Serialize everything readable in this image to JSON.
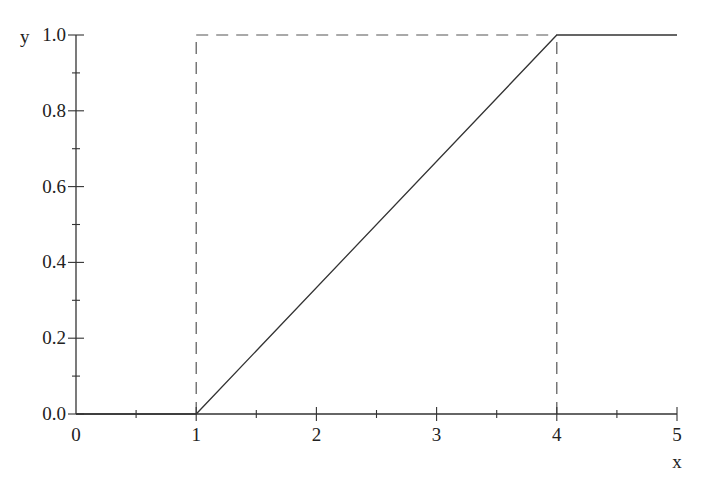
{
  "chart_data": {
    "type": "line",
    "title": "",
    "xlabel": "x",
    "ylabel": "y",
    "xlim": [
      0,
      5
    ],
    "ylim": [
      0,
      1
    ],
    "x_ticks": [
      "0",
      "1",
      "2",
      "3",
      "4",
      "5"
    ],
    "y_ticks": [
      "0.0",
      "0.2",
      "0.4",
      "0.6",
      "0.8",
      "1.0"
    ],
    "x_minor_step": 0.5,
    "y_minor_step": 0.1,
    "grid": false,
    "legend": null,
    "series": [
      {
        "name": "F(x)",
        "style": "solid",
        "x": [
          0,
          1,
          4,
          5
        ],
        "y": [
          0,
          0,
          1,
          1
        ]
      }
    ],
    "guides": [
      {
        "name": "vertical-dashed-x1",
        "style": "dashed",
        "x": [
          1,
          1
        ],
        "y": [
          0,
          1
        ]
      },
      {
        "name": "horizontal-dashed-y1",
        "style": "dashed",
        "x": [
          1,
          4
        ],
        "y": [
          1,
          1
        ]
      },
      {
        "name": "vertical-dashed-x4",
        "style": "dashed",
        "x": [
          4,
          4
        ],
        "y": [
          0,
          1
        ]
      }
    ]
  },
  "colors": {
    "axis": "#333333",
    "line": "#333333",
    "dashed": "#555555",
    "background": "#ffffff"
  }
}
